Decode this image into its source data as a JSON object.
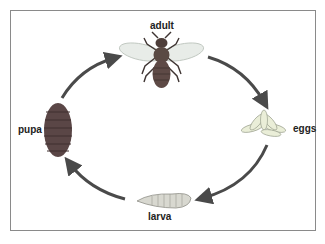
{
  "diagram": {
    "title": "",
    "type": "life-cycle",
    "stages": [
      {
        "id": "adult",
        "label": "adult"
      },
      {
        "id": "eggs",
        "label": "eggs"
      },
      {
        "id": "larva",
        "label": "larva"
      },
      {
        "id": "pupa",
        "label": "pupa"
      }
    ],
    "cycle_order": [
      "adult",
      "eggs",
      "larva",
      "pupa",
      "adult"
    ],
    "colors": {
      "arrow": "#4a4a4a",
      "border": "#8a8a8a",
      "insect_body": "#5a4a44",
      "wing": "#e8ece8",
      "egg": "#eaeed8",
      "larva": "#d8d8d0",
      "pupa": "#5a4646"
    }
  }
}
